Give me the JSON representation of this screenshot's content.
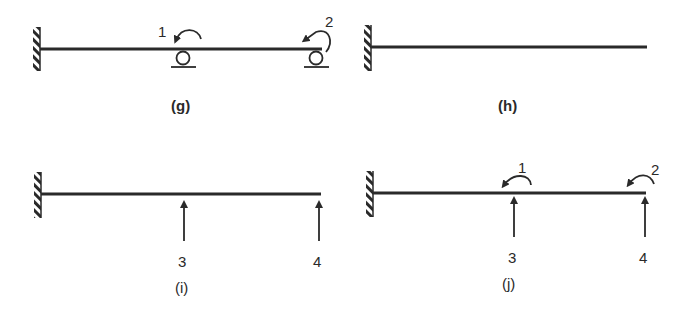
{
  "figure": {
    "colors": {
      "ink": "#2a2a2a",
      "background": "#ffffff"
    },
    "panels": [
      {
        "id": "g",
        "caption": "(g)",
        "description": "Cantilever beam fixed at left wall with two roller supports; rotational DOFs 1 and 2 shown as counterclockwise moment arrows",
        "support_left": "fixed-wall",
        "rollers": [
          "roller-1",
          "roller-2"
        ],
        "dof_labels": [
          "1",
          "2"
        ],
        "dof_types": [
          "rotation",
          "rotation"
        ]
      },
      {
        "id": "h",
        "caption": "(h)",
        "description": "Plain cantilever beam fixed at left wall",
        "support_left": "fixed-wall"
      },
      {
        "id": "i",
        "caption": "(i)",
        "description": "Cantilever beam with upward force arrows (translational DOFs) 3 and 4",
        "support_left": "fixed-wall",
        "dof_labels": [
          "3",
          "4"
        ],
        "dof_types": [
          "translation",
          "translation"
        ]
      },
      {
        "id": "j",
        "caption": "(j)",
        "description": "Cantilever beam with rotational DOFs 1, 2 and translational DOFs 3, 4",
        "support_left": "fixed-wall",
        "moment_labels": [
          "1",
          "2"
        ],
        "force_labels": [
          "3",
          "4"
        ]
      }
    ]
  }
}
